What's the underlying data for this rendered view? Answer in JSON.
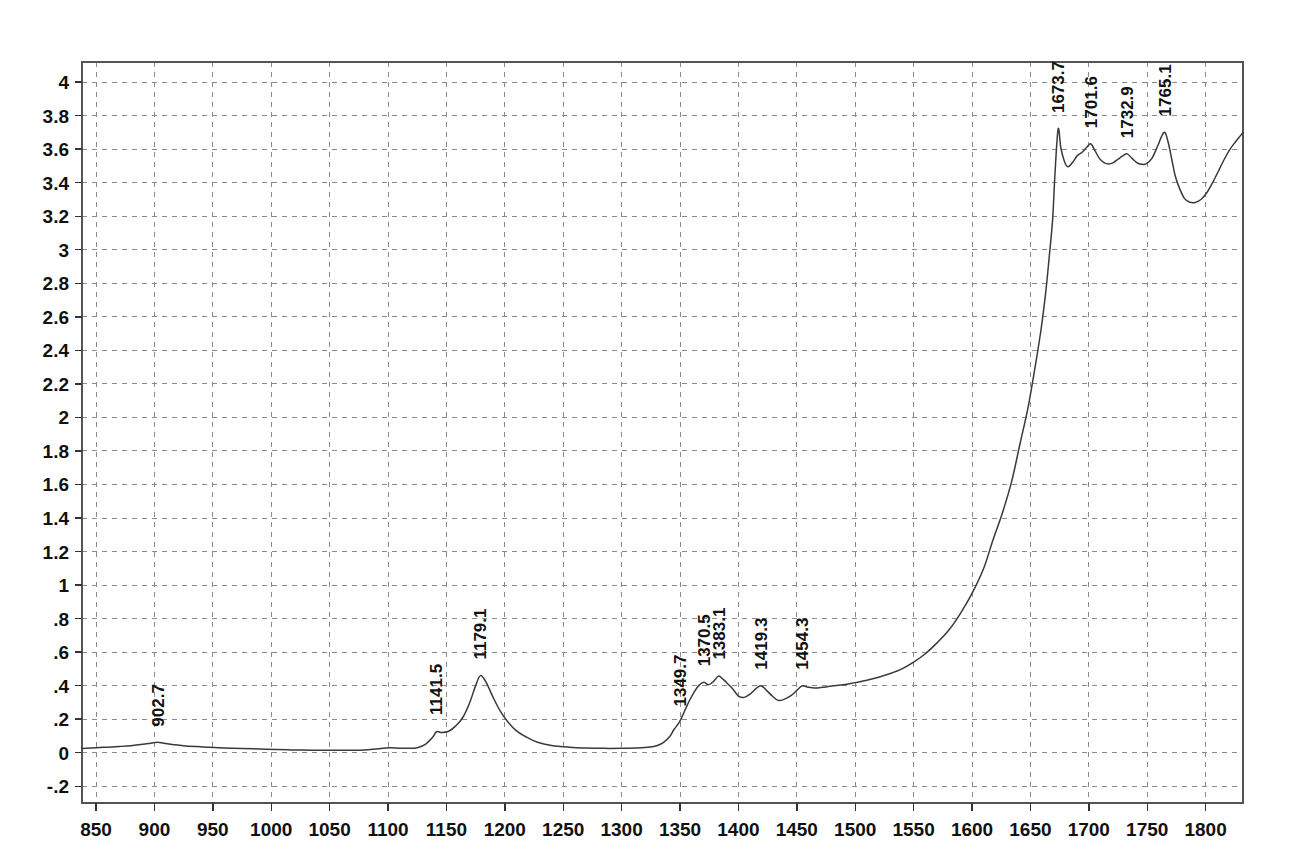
{
  "figure": {
    "kind": "ir-spectrum-plot",
    "background": "#ffffff",
    "frame_color": "#555555",
    "grid_color": "#8a8a8a",
    "curve_color": "#3a3a3a"
  },
  "chart_data": {
    "type": "line",
    "title": "",
    "xlabel": "",
    "ylabel": "",
    "xlim": [
      838,
      1832
    ],
    "ylim": [
      -0.3,
      4.12
    ],
    "grid": true,
    "legend": null,
    "xticks": [
      850,
      900,
      950,
      1000,
      1050,
      1100,
      1150,
      1200,
      1250,
      1300,
      1350,
      1400,
      1450,
      1500,
      1550,
      1600,
      1650,
      1700,
      1750,
      1800
    ],
    "xtick_labels": [
      "850",
      "900",
      "950",
      "1000",
      "1050",
      "1100",
      "1150",
      "1200",
      "1250",
      "1300",
      "1350",
      "1400",
      "1450",
      "1500",
      "1550",
      "1600",
      "1650",
      "1700",
      "1750",
      "1800"
    ],
    "yticks": [
      -0.2,
      0,
      0.2,
      0.4,
      0.6,
      0.8,
      1.0,
      1.2,
      1.4,
      1.6,
      1.8,
      2.0,
      2.2,
      2.4,
      2.6,
      2.8,
      3.0,
      3.2,
      3.4,
      3.6,
      3.8,
      4.0
    ],
    "ytick_labels": [
      "-.2",
      "0",
      ".2",
      ".4",
      ".6",
      ".8",
      "1",
      "1.2",
      "1.4",
      "1.6",
      "1.8",
      "2",
      "2.2",
      "2.4",
      "2.6",
      "2.8",
      "3",
      "3.2",
      "3.4",
      "3.6",
      "3.8",
      "4"
    ],
    "annotations": [
      {
        "label": "902.7",
        "x": 902.7,
        "y": 0.06,
        "rotation": -90
      },
      {
        "label": "1141.5",
        "x": 1141.5,
        "y": 0.13,
        "rotation": -90
      },
      {
        "label": "1179.1",
        "x": 1179.1,
        "y": 0.46,
        "rotation": -90
      },
      {
        "label": "1349.7",
        "x": 1349.7,
        "y": 0.18,
        "rotation": -90
      },
      {
        "label": "1370.5",
        "x": 1370.5,
        "y": 0.42,
        "rotation": -90
      },
      {
        "label": "1383.1",
        "x": 1383.1,
        "y": 0.46,
        "rotation": -90
      },
      {
        "label": "1419.3",
        "x": 1419.3,
        "y": 0.4,
        "rotation": -90
      },
      {
        "label": "1454.3",
        "x": 1454.3,
        "y": 0.4,
        "rotation": -90
      },
      {
        "label": "1673.7",
        "x": 1673.7,
        "y": 3.72,
        "rotation": -90
      },
      {
        "label": "1701.6",
        "x": 1701.6,
        "y": 3.63,
        "rotation": -90
      },
      {
        "label": "1732.9",
        "x": 1732.9,
        "y": 3.57,
        "rotation": -90
      },
      {
        "label": "1765.1",
        "x": 1765.1,
        "y": 3.7,
        "rotation": -90
      }
    ],
    "series": [
      {
        "name": "absorbance",
        "x": [
          838,
          845,
          850,
          860,
          870,
          880,
          890,
          897,
          902.7,
          908,
          915,
          925,
          935,
          945,
          955,
          965,
          975,
          985,
          995,
          1005,
          1015,
          1025,
          1035,
          1045,
          1055,
          1065,
          1075,
          1085,
          1092,
          1098,
          1103,
          1110,
          1118,
          1125,
          1132,
          1138,
          1141.5,
          1146,
          1152,
          1158,
          1164,
          1170,
          1175,
          1179.1,
          1184,
          1190,
          1196,
          1203,
          1210,
          1218,
          1228,
          1240,
          1255,
          1270,
          1285,
          1300,
          1312,
          1322,
          1330,
          1336,
          1341,
          1345,
          1349.7,
          1354,
          1358,
          1362,
          1366,
          1370.5,
          1374,
          1377,
          1380,
          1383.1,
          1387,
          1391,
          1395,
          1400,
          1405,
          1410,
          1415,
          1419.3,
          1424,
          1429,
          1434,
          1439,
          1445,
          1450,
          1454.3,
          1459,
          1465,
          1472,
          1480,
          1490,
          1500,
          1510,
          1520,
          1530,
          1540,
          1550,
          1560,
          1570,
          1580,
          1590,
          1600,
          1610,
          1618,
          1626,
          1634,
          1641,
          1648,
          1654,
          1659,
          1663,
          1666,
          1669,
          1671,
          1673.7,
          1676,
          1679,
          1682,
          1686,
          1690,
          1694,
          1698,
          1701.6,
          1705,
          1709,
          1713,
          1717,
          1721,
          1725,
          1729,
          1732.9,
          1737,
          1741,
          1745,
          1749,
          1754,
          1759,
          1762,
          1765.1,
          1768,
          1771,
          1774,
          1778,
          1782,
          1786,
          1791,
          1796,
          1801,
          1806,
          1811,
          1816,
          1820,
          1824,
          1828,
          1832
        ],
        "y": [
          0.025,
          0.028,
          0.03,
          0.033,
          0.037,
          0.042,
          0.05,
          0.057,
          0.062,
          0.056,
          0.049,
          0.042,
          0.037,
          0.033,
          0.03,
          0.027,
          0.025,
          0.023,
          0.021,
          0.019,
          0.017,
          0.016,
          0.015,
          0.014,
          0.014,
          0.014,
          0.015,
          0.019,
          0.024,
          0.028,
          0.029,
          0.027,
          0.026,
          0.03,
          0.05,
          0.09,
          0.125,
          0.12,
          0.128,
          0.16,
          0.21,
          0.3,
          0.4,
          0.46,
          0.42,
          0.33,
          0.25,
          0.18,
          0.13,
          0.095,
          0.062,
          0.043,
          0.033,
          0.028,
          0.026,
          0.026,
          0.028,
          0.032,
          0.042,
          0.062,
          0.095,
          0.14,
          0.185,
          0.25,
          0.31,
          0.36,
          0.4,
          0.42,
          0.405,
          0.415,
          0.435,
          0.458,
          0.437,
          0.41,
          0.382,
          0.338,
          0.33,
          0.35,
          0.382,
          0.4,
          0.372,
          0.338,
          0.312,
          0.318,
          0.34,
          0.372,
          0.398,
          0.392,
          0.386,
          0.39,
          0.398,
          0.405,
          0.418,
          0.432,
          0.45,
          0.472,
          0.5,
          0.54,
          0.59,
          0.655,
          0.73,
          0.83,
          0.95,
          1.1,
          1.27,
          1.43,
          1.62,
          1.84,
          2.06,
          2.3,
          2.52,
          2.74,
          2.95,
          3.18,
          3.45,
          3.72,
          3.61,
          3.53,
          3.495,
          3.52,
          3.56,
          3.58,
          3.61,
          3.632,
          3.595,
          3.545,
          3.52,
          3.512,
          3.52,
          3.54,
          3.56,
          3.572,
          3.545,
          3.52,
          3.51,
          3.512,
          3.545,
          3.62,
          3.672,
          3.7,
          3.64,
          3.54,
          3.44,
          3.36,
          3.305,
          3.285,
          3.282,
          3.3,
          3.34,
          3.4,
          3.47,
          3.54,
          3.59,
          3.63,
          3.665,
          3.7
        ]
      }
    ]
  }
}
